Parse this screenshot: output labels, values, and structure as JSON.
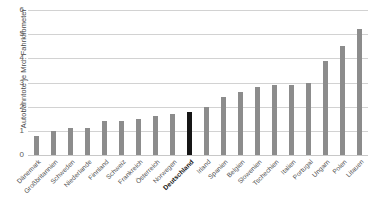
{
  "chart_data": {
    "type": "bar",
    "title": "",
    "xlabel": "",
    "ylabel": "Autobahntote je Mrd. Fahrkilometer",
    "ylim": [
      0,
      6
    ],
    "yticks": [
      0,
      1,
      2,
      3,
      4,
      5,
      6
    ],
    "grid": true,
    "legend": "none",
    "highlight_category": "Deutschland",
    "colors": {
      "bar": "#8c8c8c",
      "highlight": "#161616",
      "gridline": "#d2d2d2",
      "text": "#4f4f4f"
    },
    "categories": [
      "Dänemark",
      "Großbritannien",
      "Schweden",
      "Niederlande",
      "Finnland",
      "Schweiz",
      "Frankreich",
      "Österreich",
      "Norwegen",
      "Deutschland",
      "Irland",
      "Spanien",
      "Belgien",
      "Slowenien",
      "Tschechien",
      "Italien",
      "Portugal",
      "Ungarn",
      "Polen",
      "Litauen"
    ],
    "values": [
      0.8,
      1.0,
      1.1,
      1.1,
      1.4,
      1.4,
      1.5,
      1.6,
      1.7,
      1.8,
      2.0,
      2.4,
      2.6,
      2.8,
      2.9,
      2.9,
      3.0,
      3.9,
      4.5,
      5.2
    ]
  }
}
